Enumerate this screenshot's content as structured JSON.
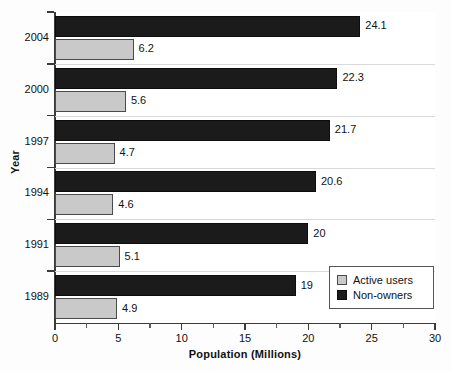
{
  "chart_data": {
    "type": "bar",
    "orientation": "horizontal",
    "title": "",
    "xlabel": "Population (Millions)",
    "ylabel": "Year",
    "categories": [
      "2004",
      "2000",
      "1997",
      "1994",
      "1991",
      "1989"
    ],
    "series": [
      {
        "name": "Active users",
        "color": "#c9c9c9",
        "values": [
          6.2,
          5.6,
          4.7,
          4.6,
          5.1,
          4.9
        ],
        "labels": [
          "6.2",
          "5.6",
          "4.7",
          "4.6",
          "5.1",
          "4.9"
        ]
      },
      {
        "name": "Non-owners",
        "color": "#1b1b1b",
        "values": [
          24.1,
          22.3,
          21.7,
          20.6,
          20,
          19
        ],
        "labels": [
          "24.1",
          "22.3",
          "21.7",
          "20.6",
          "20",
          "19"
        ]
      }
    ],
    "xlim": [
      0,
      30
    ],
    "xticks": [
      0,
      5,
      10,
      15,
      20,
      25,
      30
    ],
    "xtick_labels": [
      "0",
      "5",
      "10",
      "15",
      "20",
      "25",
      "30"
    ],
    "xminor_ticks": [
      2.5,
      7.5,
      12.5,
      17.5,
      22.5,
      27.5
    ],
    "grid": true,
    "grid_axis": "y",
    "legend_position": "bottom-right",
    "series_order_in_group": [
      "Non-owners",
      "Active users"
    ]
  },
  "legend": {
    "entries": [
      {
        "label": "Active users",
        "swatch": "light"
      },
      {
        "label": "Non-owners",
        "swatch": "dark"
      }
    ]
  }
}
